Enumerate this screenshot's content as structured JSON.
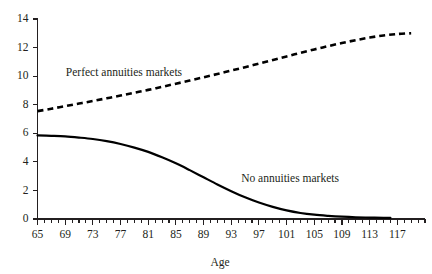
{
  "chart_data": {
    "type": "line",
    "title": "",
    "xlabel": "Age",
    "ylabel": "",
    "xlim": [
      65,
      121
    ],
    "ylim": [
      0,
      14
    ],
    "grid": false,
    "legend_position": "inline-annotations",
    "x_tick_labels": [
      "65",
      "69",
      "73",
      "77",
      "81",
      "85",
      "89",
      "93",
      "97",
      "101",
      "105",
      "109",
      "113",
      "117"
    ],
    "x_tick_values": [
      65,
      69,
      73,
      77,
      81,
      85,
      89,
      93,
      97,
      101,
      105,
      109,
      113,
      117
    ],
    "x_minor_step": 1,
    "y_tick_labels": [
      "0",
      "2",
      "4",
      "6",
      "8",
      "10",
      "12",
      "14"
    ],
    "y_tick_values": [
      0,
      2,
      4,
      6,
      8,
      10,
      12,
      14
    ],
    "series": [
      {
        "name": "Perfect annuities markets",
        "style": "dashed",
        "color": "#000000",
        "annotation": "Perfect annuities markets",
        "x": [
          65,
          67,
          69,
          71,
          73,
          75,
          77,
          79,
          81,
          83,
          85,
          87,
          89,
          91,
          93,
          95,
          97,
          99,
          101,
          103,
          105,
          107,
          109,
          111,
          113,
          115,
          117,
          119
        ],
        "values": [
          7.55,
          7.72,
          7.9,
          8.08,
          8.26,
          8.45,
          8.64,
          8.84,
          9.04,
          9.25,
          9.47,
          9.69,
          9.92,
          10.15,
          10.39,
          10.63,
          10.88,
          11.13,
          11.38,
          11.63,
          11.87,
          12.1,
          12.32,
          12.52,
          12.7,
          12.85,
          12.95,
          13.0
        ]
      },
      {
        "name": "No annuities markets",
        "style": "solid",
        "color": "#000000",
        "annotation": "No annuities markets",
        "x": [
          65,
          67,
          69,
          71,
          73,
          75,
          77,
          79,
          81,
          83,
          85,
          87,
          89,
          91,
          93,
          95,
          97,
          99,
          101,
          103,
          105,
          107,
          109,
          111,
          113,
          115,
          116
        ],
        "values": [
          5.85,
          5.82,
          5.78,
          5.7,
          5.6,
          5.45,
          5.25,
          5.0,
          4.7,
          4.32,
          3.9,
          3.42,
          2.92,
          2.42,
          1.95,
          1.52,
          1.15,
          0.85,
          0.6,
          0.42,
          0.3,
          0.22,
          0.16,
          0.12,
          0.1,
          0.08,
          0.08
        ]
      }
    ],
    "annotations": [
      {
        "text": "Perfect annuities markets",
        "x_value": 77.5,
        "y_value": 10.0
      },
      {
        "text": "No annuities markets",
        "x_value": 101.5,
        "y_value": 2.6
      }
    ]
  }
}
